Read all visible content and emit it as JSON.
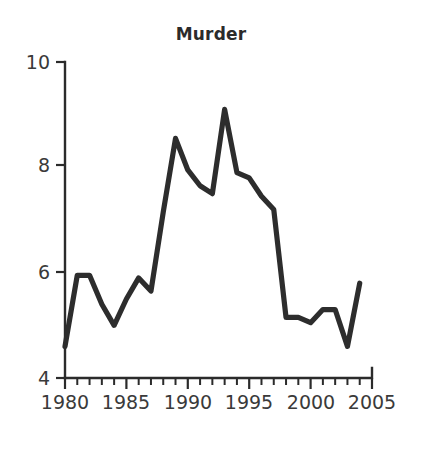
{
  "chart_data": {
    "type": "line",
    "title": "Murder",
    "xlabel": "",
    "ylabel": "",
    "x": [
      1980,
      1981,
      1982,
      1983,
      1984,
      1985,
      1986,
      1987,
      1988,
      1989,
      1990,
      1991,
      1992,
      1993,
      1994,
      1995,
      1996,
      1997,
      1998,
      1999,
      2000,
      2001,
      2002,
      2003,
      2004
    ],
    "values": [
      4.6,
      5.95,
      5.95,
      5.4,
      5.0,
      5.5,
      5.9,
      5.65,
      7.15,
      8.55,
      7.95,
      7.65,
      7.5,
      9.1,
      7.9,
      7.8,
      7.45,
      7.2,
      5.15,
      5.15,
      5.05,
      5.3,
      5.3,
      4.6,
      5.8
    ],
    "series": [
      {
        "name": "Murder",
        "values": [
          4.6,
          5.95,
          5.95,
          5.4,
          5.0,
          5.5,
          5.9,
          5.65,
          7.15,
          8.55,
          7.95,
          7.65,
          7.5,
          9.1,
          7.9,
          7.8,
          7.45,
          7.2,
          5.15,
          5.15,
          5.05,
          5.3,
          5.3,
          4.6,
          5.8
        ]
      }
    ],
    "xlim": [
      1980,
      2005
    ],
    "ylim": [
      4,
      10
    ],
    "x_ticks_major": [
      1980,
      1985,
      1990,
      1995,
      2000,
      2005
    ],
    "x_tick_labels": [
      "1980",
      "1985",
      "1990",
      "1995",
      "2000",
      "2005"
    ],
    "x_tick_minor_step": 1,
    "y_ticks": [
      4,
      6,
      8,
      10
    ],
    "y_tick_labels": [
      "4",
      "6",
      "8",
      "10"
    ],
    "grid": false,
    "legend": "none",
    "line_color": "#2d2d2d",
    "axis_color": "#2b2b2b",
    "background_color": "#ffffff"
  }
}
